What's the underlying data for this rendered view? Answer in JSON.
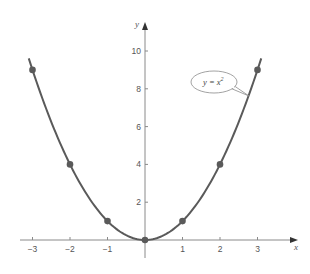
{
  "chart_data": {
    "type": "line",
    "title": "",
    "function": "y = x^2",
    "xlabel": "x",
    "ylabel": "y",
    "xlim": [
      -3.3,
      4
    ],
    "ylim": [
      -1,
      11
    ],
    "grid": false,
    "x_ticks": [
      -3,
      -2,
      -1,
      1,
      2,
      3
    ],
    "x_tick_labels": [
      "−3",
      "−2",
      "−1",
      "1",
      "2",
      "3"
    ],
    "y_ticks": [
      2,
      4,
      6,
      8,
      10
    ],
    "y_tick_labels": [
      "2",
      "4",
      "6",
      "8",
      "10"
    ],
    "series": [
      {
        "name": "y = x^2",
        "curve_domain": [
          -3.1,
          3.1
        ],
        "x": [
          -3,
          -2,
          -1,
          0,
          1,
          2,
          3
        ],
        "y": [
          9,
          4,
          1,
          0,
          1,
          4,
          9
        ]
      }
    ],
    "annotations": [
      {
        "text": "y = x²",
        "type": "callout",
        "points_to": [
          2.8,
          7.7
        ]
      }
    ],
    "colors": {
      "curve": "#5a5a5a",
      "points": "#5a5a5a",
      "axes": "#8a8a8a"
    }
  },
  "labels": {
    "x_axis": "x",
    "y_axis": "y",
    "callout_main": "y = x",
    "callout_sup": "2"
  }
}
